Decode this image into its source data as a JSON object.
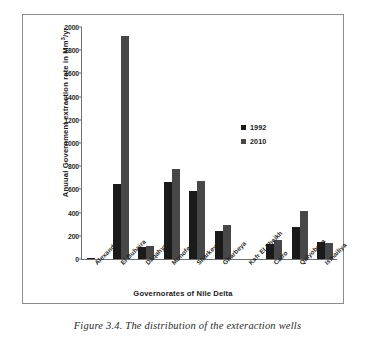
{
  "caption": "Figure 3.4. The distribution of the exteraction wells",
  "legend": {
    "items": [
      {
        "label": "1992",
        "color": "#1a1a1a"
      },
      {
        "label": "2010",
        "color": "#474747"
      }
    ]
  },
  "chart_data": {
    "type": "bar",
    "title": "",
    "xlabel": "Governorates of Nile Delta",
    "ylabel": "Anuual Government extraction rate  in Mm3/yr",
    "ylabel_parts": {
      "pre": "Anuual Government extraction rate  in Mm",
      "sup": "3",
      "post": "/yr"
    },
    "categories": [
      "Alexandria",
      "El Buhaira",
      "Daqahyea",
      "Monofeya",
      "Sharkeya",
      "Gharbeya",
      "Kafr El Sheikh",
      "Cairo",
      "Qalyobeya",
      "Ismailiya"
    ],
    "series": [
      {
        "name": "1992",
        "color": "#1a1a1a",
        "values": [
          5,
          650,
          100,
          660,
          590,
          240,
          0,
          130,
          280,
          150
        ]
      },
      {
        "name": "2010",
        "color": "#474747",
        "values": [
          0,
          1920,
          110,
          780,
          670,
          290,
          0,
          160,
          410,
          140
        ]
      }
    ],
    "ylim": [
      0,
      2000
    ],
    "yticks": [
      0,
      200,
      400,
      600,
      800,
      1000,
      1200,
      1400,
      1600,
      1800,
      2000
    ],
    "ytick_labels": [
      "0",
      "200",
      "400",
      "600",
      "800",
      "1000",
      "1200",
      "1400",
      "1600",
      "1800",
      "2000"
    ],
    "grid": false,
    "legend_position": "inside-right"
  }
}
